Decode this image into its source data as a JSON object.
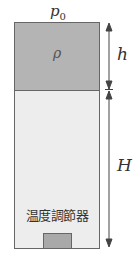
{
  "diagram": {
    "top_pressure_label": "p",
    "top_pressure_subscript": "0",
    "liquid_density_label": "ρ",
    "liquid_height_label": "h",
    "gas_height_label": "H",
    "heater_label": "温度調節器"
  },
  "colors": {
    "liquid": "#b4b4b4",
    "gas": "#ededed",
    "heater": "#a9a9a9",
    "outline": "#666666"
  }
}
